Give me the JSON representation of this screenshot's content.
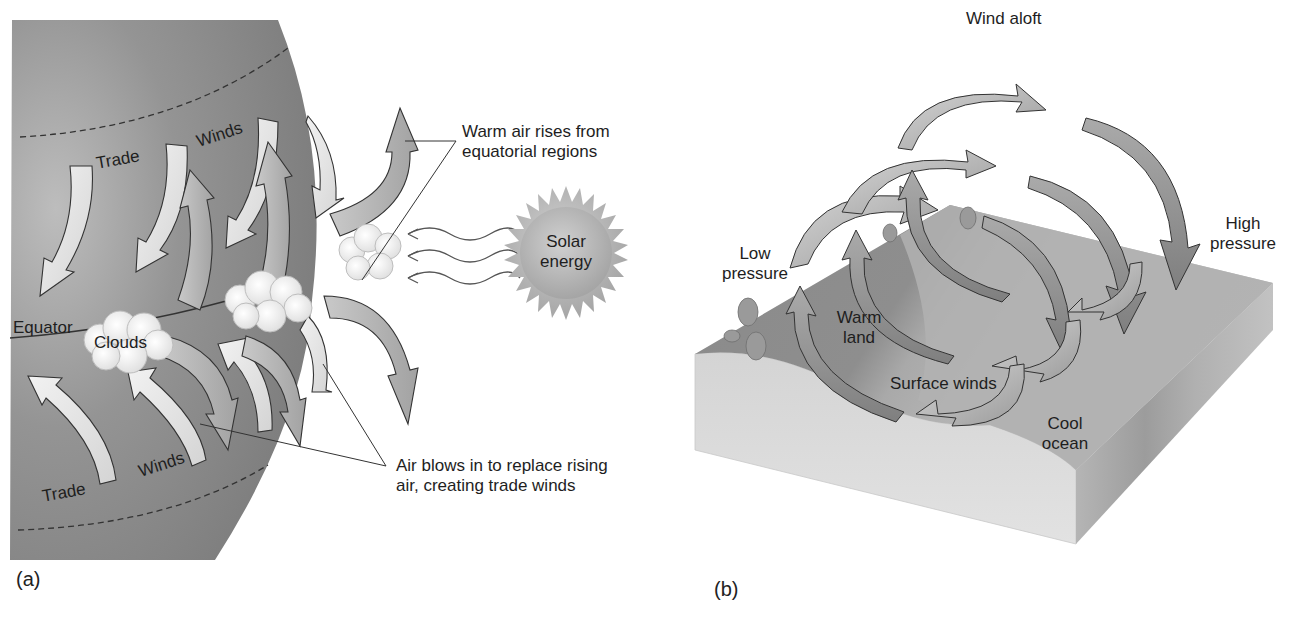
{
  "figure": {
    "panel_a": {
      "letter": "(a)",
      "labels": {
        "trade_top": "Trade",
        "winds_top": "Winds",
        "equator": "Equator",
        "clouds": "Clouds",
        "trade_bottom": "Trade",
        "winds_bottom": "Winds",
        "solar_line1": "Solar",
        "solar_line2": "energy"
      },
      "callouts": {
        "warm_air_line1": "Warm air rises from",
        "warm_air_line2": "equatorial regions",
        "air_blows_line1": "Air blows in to replace rising",
        "air_blows_line2": "air, creating trade winds"
      }
    },
    "panel_b": {
      "letter": "(b)",
      "labels": {
        "wind_aloft": "Wind aloft",
        "low_line1": "Low",
        "low_line2": "pressure",
        "high_line1": "High",
        "high_line2": "pressure",
        "warm_line1": "Warm",
        "warm_line2": "land",
        "surface_winds": "Surface winds",
        "cool_line1": "Cool",
        "cool_line2": "ocean"
      }
    },
    "colors": {
      "globe": "#8f8f8f",
      "arrow_light": "#e6e6e6",
      "arrow_mid": "#b5b5b5",
      "arrow_dark": "#8a8a8a",
      "land": "#8c8c8c",
      "ocean": "#b3b3b3",
      "block_side": "#d6d6d6",
      "sun": "#b9b9b9"
    }
  }
}
